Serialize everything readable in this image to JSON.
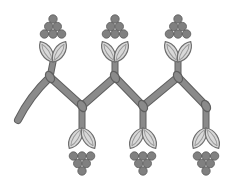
{
  "image": {
    "title": "Grapevine ornamental border",
    "description": "Gray line-art illustration of a zigzag vine with six grape clusters, three above and three below"
  },
  "colors": {
    "background": "#ffffff",
    "vine_fill": "#8a8a8a",
    "vine_outline": "#5f5f5f",
    "grape_fill": "#808080",
    "grape_outline": "#5a5a5a",
    "leaf_fill": "#d9d9d9",
    "leaf_outline": "#6e6e6e",
    "leaf_vein": "#9a9a9a"
  },
  "vine": {
    "points": [
      [
        18,
        120
      ],
      [
        30,
        96
      ],
      [
        50,
        77
      ],
      [
        82,
        106
      ],
      [
        115,
        77
      ],
      [
        143,
        106
      ],
      [
        178,
        77
      ],
      [
        206,
        106
      ]
    ],
    "knots": [
      [
        50,
        77
      ],
      [
        82,
        106
      ],
      [
        115,
        77
      ],
      [
        143,
        106
      ],
      [
        178,
        77
      ],
      [
        206,
        106
      ]
    ]
  },
  "clusters": [
    {
      "id": "top-1",
      "x": 53,
      "orientation": "up",
      "stem_from": [
        50,
        77
      ],
      "stem_to": [
        53,
        62
      ]
    },
    {
      "id": "top-2",
      "x": 115,
      "orientation": "up",
      "stem_from": [
        115,
        77
      ],
      "stem_to": [
        115,
        62
      ]
    },
    {
      "id": "top-3",
      "x": 178,
      "orientation": "up",
      "stem_from": [
        178,
        77
      ],
      "stem_to": [
        178,
        62
      ]
    },
    {
      "id": "bottom-1",
      "x": 82,
      "orientation": "down",
      "stem_from": [
        82,
        106
      ],
      "stem_to": [
        82,
        128
      ]
    },
    {
      "id": "bottom-2",
      "x": 143,
      "orientation": "down",
      "stem_from": [
        143,
        106
      ],
      "stem_to": [
        143,
        128
      ]
    },
    {
      "id": "bottom-3",
      "x": 206,
      "orientation": "down",
      "stem_from": [
        206,
        106
      ],
      "stem_to": [
        206,
        128
      ]
    }
  ]
}
